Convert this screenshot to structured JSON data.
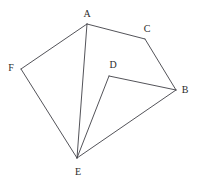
{
  "figure": {
    "background_color": "#ffffff",
    "line_color": "#3f3f46",
    "label_color": "#2b2b2b",
    "width": 197,
    "height": 184,
    "vertices": [
      {
        "id": "A",
        "label": "A",
        "x": 87,
        "y": 24,
        "label_x": 87,
        "label_y": 14
      },
      {
        "id": "B",
        "label": "B",
        "x": 176,
        "y": 90,
        "label_x": 185,
        "label_y": 90
      },
      {
        "id": "C",
        "label": "C",
        "x": 145,
        "y": 39,
        "label_x": 147,
        "label_y": 29
      },
      {
        "id": "D",
        "label": "D",
        "x": 109,
        "y": 76,
        "label_x": 113,
        "label_y": 65
      },
      {
        "id": "E",
        "label": "E",
        "x": 77,
        "y": 158,
        "label_x": 78,
        "label_y": 172
      },
      {
        "id": "F",
        "label": "F",
        "x": 21,
        "y": 69,
        "label_x": 11,
        "label_y": 68
      }
    ],
    "edges": [
      {
        "from": "A",
        "to": "F"
      },
      {
        "from": "A",
        "to": "C"
      },
      {
        "from": "A",
        "to": "E"
      },
      {
        "from": "C",
        "to": "B"
      },
      {
        "from": "D",
        "to": "B"
      },
      {
        "from": "D",
        "to": "E"
      },
      {
        "from": "B",
        "to": "E"
      },
      {
        "from": "F",
        "to": "E"
      }
    ]
  }
}
